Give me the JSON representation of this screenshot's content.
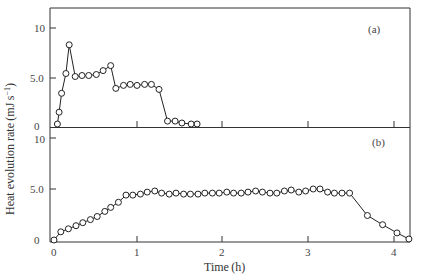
{
  "chart_data": [
    {
      "type": "line",
      "panel": "(a)",
      "title": "",
      "xlabel": "Time (h)",
      "ylabel": "Heat evolution rate (mJ s^-1)",
      "xlim": [
        0,
        4.2
      ],
      "ylim": [
        0,
        12
      ],
      "yticks": [
        0,
        5.0,
        10
      ],
      "ytick_labels": [
        "0",
        "5.0",
        "10"
      ],
      "xticks": [
        0,
        1,
        2,
        3,
        4
      ],
      "grid": false,
      "marker": "open-circle",
      "series": [
        {
          "name": "a",
          "x": [
            0.04,
            0.06,
            0.09,
            0.14,
            0.18,
            0.25,
            0.33,
            0.41,
            0.5,
            0.58,
            0.67,
            0.73,
            0.82,
            0.9,
            0.98,
            1.07,
            1.15,
            1.24,
            1.34,
            1.43,
            1.51,
            1.62,
            1.69
          ],
          "values": [
            0.3,
            1.5,
            3.4,
            5.4,
            8.3,
            5.1,
            5.2,
            5.2,
            5.3,
            5.7,
            6.2,
            3.9,
            4.2,
            4.3,
            4.2,
            4.3,
            4.3,
            3.8,
            0.6,
            0.6,
            0.4,
            0.3,
            0.3
          ]
        }
      ]
    },
    {
      "type": "line",
      "panel": "(b)",
      "title": "",
      "xlabel": "Time (h)",
      "ylabel": "Heat evolution rate (mJ s^-1)",
      "xlim": [
        0,
        4.2
      ],
      "ylim": [
        0,
        11
      ],
      "yticks": [
        0,
        5.0,
        10
      ],
      "ytick_labels": [
        "0",
        "5.0",
        "10"
      ],
      "xticks": [
        0,
        1,
        2,
        3,
        4
      ],
      "xtick_labels": [
        "0",
        "1",
        "2",
        "3",
        "4"
      ],
      "grid": false,
      "marker": "open-circle",
      "series": [
        {
          "name": "b",
          "x": [
            0.0,
            0.08,
            0.17,
            0.26,
            0.34,
            0.43,
            0.51,
            0.6,
            0.67,
            0.76,
            0.85,
            0.93,
            1.02,
            1.1,
            1.19,
            1.27,
            1.36,
            1.44,
            1.53,
            1.61,
            1.7,
            1.78,
            1.87,
            1.95,
            2.04,
            2.12,
            2.21,
            2.29,
            2.38,
            2.46,
            2.55,
            2.63,
            2.72,
            2.8,
            2.89,
            2.97,
            3.06,
            3.14,
            3.23,
            3.31,
            3.4,
            3.49,
            3.7,
            3.88,
            4.05,
            4.19
          ],
          "values": [
            0.0,
            0.8,
            1.1,
            1.4,
            1.7,
            2.0,
            2.3,
            2.8,
            3.2,
            3.7,
            4.4,
            4.4,
            4.5,
            4.7,
            4.8,
            4.6,
            4.5,
            4.6,
            4.5,
            4.5,
            4.5,
            4.6,
            4.6,
            4.6,
            4.7,
            4.6,
            4.6,
            4.7,
            4.8,
            4.7,
            4.6,
            4.6,
            4.8,
            4.9,
            4.7,
            4.8,
            5.0,
            5.0,
            4.7,
            4.6,
            4.6,
            4.6,
            2.4,
            1.5,
            0.7,
            0.1
          ]
        }
      ]
    }
  ],
  "labels": {
    "panel_a": "(a)",
    "panel_b": "(b)",
    "xlabel": "Time (h)",
    "ylabel": "Heat evolution rate (mJ s",
    "ylabel_sup": "−1",
    "ylabel_close": ")",
    "ytick_0": "0",
    "ytick_5": "5.0",
    "ytick_10": "10",
    "xtick_0": "0",
    "xtick_1": "1",
    "xtick_2": "2",
    "xtick_3": "3",
    "xtick_4": "4"
  }
}
